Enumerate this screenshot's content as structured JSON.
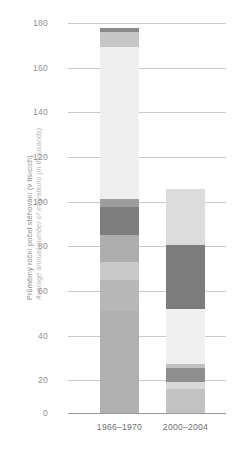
{
  "axis": {
    "y_title_cs": "Průměrný roční počet stěhování (v tisících)",
    "y_title_en": "Average annual number of migrations (in thousands)"
  },
  "ticks": {
    "t0": "0",
    "t20": "20",
    "t40": "40",
    "t60": "60",
    "t80": "80",
    "t100": "100",
    "t120": "120",
    "t140": "140",
    "t160": "160",
    "t180": "180"
  },
  "categories": {
    "c0": "1966–1970",
    "c1": "2000–2004"
  },
  "chart_data": {
    "type": "bar",
    "title": "",
    "subtitle": "",
    "xlabel": "",
    "ylabel": "Průměrný roční počet stěhování (v tisících) / Average annual number of migrations (in thousands)",
    "stacked": true,
    "ylim": [
      0,
      180
    ],
    "yticks": [
      0,
      20,
      40,
      60,
      80,
      100,
      120,
      140,
      160,
      180
    ],
    "grid": "horizontal",
    "legend": "none",
    "categories": [
      "1966–1970",
      "2000–2004"
    ],
    "totals": [
      173.5,
      101.0
    ],
    "bars": [
      {
        "category": "1966–1970",
        "total": 173.5,
        "segments": [
          {
            "index": 0,
            "from": 0.0,
            "to": 46.0,
            "value": 46.0,
            "color": "#b0b0b0"
          },
          {
            "index": 1,
            "from": 46.0,
            "to": 60.0,
            "value": 14.0,
            "color": "#b8b8b8"
          },
          {
            "index": 2,
            "from": 60.0,
            "to": 68.0,
            "value": 8.0,
            "color": "#c9c9c9"
          },
          {
            "index": 3,
            "from": 68.0,
            "to": 80.5,
            "value": 12.5,
            "color": "#aeaeae"
          },
          {
            "index": 4,
            "from": 80.5,
            "to": 93.0,
            "value": 12.5,
            "color": "#7e7e7e"
          },
          {
            "index": 5,
            "from": 93.0,
            "to": 96.5,
            "value": 3.5,
            "color": "#9d9d9d"
          },
          {
            "index": 6,
            "from": 96.5,
            "to": 165.0,
            "value": 68.5,
            "color": "#efefef"
          },
          {
            "index": 7,
            "from": 165.0,
            "to": 172.0,
            "value": 7.0,
            "color": "#c6c6c6"
          },
          {
            "index": 8,
            "from": 172.0,
            "to": 173.5,
            "value": 1.5,
            "color": "#8a8a8a"
          }
        ]
      },
      {
        "category": "2000–2004",
        "total": 101.0,
        "segments": [
          {
            "index": 0,
            "from": 0.0,
            "to": 11.0,
            "value": 11.0,
            "color": "#c2c2c2"
          },
          {
            "index": 1,
            "from": 11.0,
            "to": 14.0,
            "value": 3.0,
            "color": "#d8d8d8"
          },
          {
            "index": 2,
            "from": 14.0,
            "to": 20.5,
            "value": 6.5,
            "color": "#8e8e8e"
          },
          {
            "index": 3,
            "from": 20.5,
            "to": 22.0,
            "value": 1.5,
            "color": "#c0c0c0"
          },
          {
            "index": 4,
            "from": 22.0,
            "to": 47.0,
            "value": 25.0,
            "color": "#f0f0f0"
          },
          {
            "index": 5,
            "from": 47.0,
            "to": 76.0,
            "value": 29.0,
            "color": "#7c7c7c"
          },
          {
            "index": 6,
            "from": 76.0,
            "to": 101.0,
            "value": 25.0,
            "color": "#dcdcdc"
          }
        ]
      }
    ]
  }
}
